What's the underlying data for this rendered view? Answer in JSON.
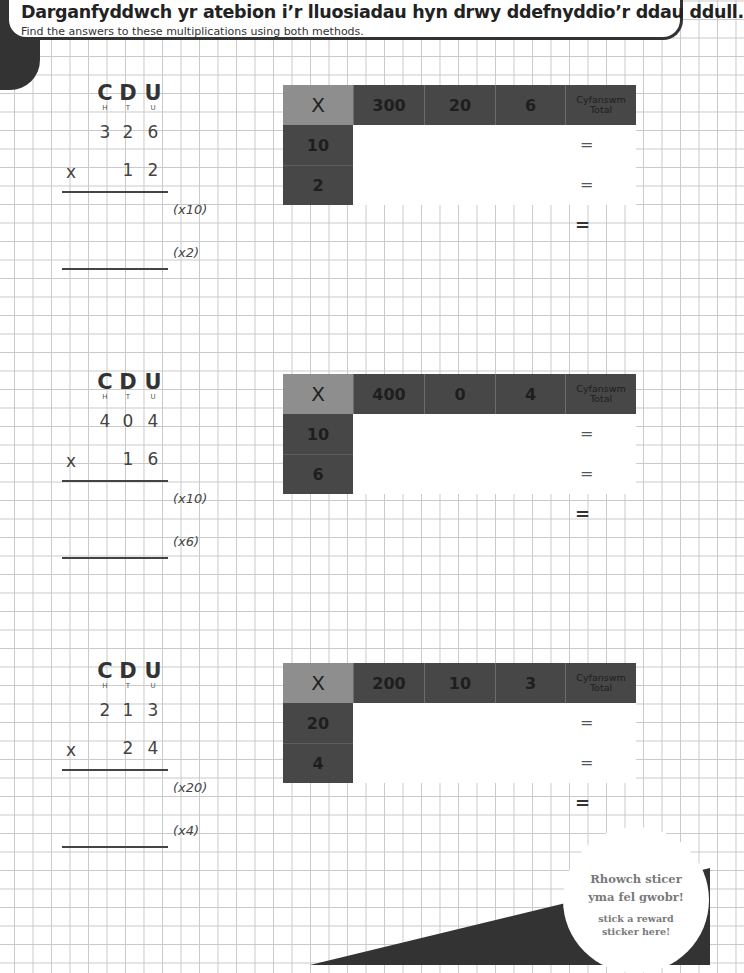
{
  "header": {
    "title": "Darganfyddwch yr atebion i’r lluosiadau hyn drwy ddefnyddio’r ddau ddull.",
    "subtitle": "Find the answers to these multiplications using both methods."
  },
  "place_values": {
    "hundreds": {
      "cy": "C",
      "en": "H"
    },
    "tens": {
      "cy": "D",
      "en": "T"
    },
    "units": {
      "cy": "U",
      "en": "U"
    }
  },
  "times_sign": "x",
  "equals": "=",
  "grid_corner": "X",
  "total_label": {
    "cy": "Cyfanswm",
    "en": "Total"
  },
  "problems": [
    {
      "multiplicand": [
        "3",
        "2",
        "6"
      ],
      "multiplier": [
        "1",
        "2"
      ],
      "partials": [
        "(x10)",
        "(x2)"
      ],
      "grid": {
        "columns": [
          "300",
          "20",
          "6"
        ],
        "rows": [
          "10",
          "2"
        ]
      }
    },
    {
      "multiplicand": [
        "4",
        "0",
        "4"
      ],
      "multiplier": [
        "1",
        "6"
      ],
      "partials": [
        "(x10)",
        "(x6)"
      ],
      "grid": {
        "columns": [
          "400",
          "0",
          "4"
        ],
        "rows": [
          "10",
          "6"
        ]
      }
    },
    {
      "multiplicand": [
        "2",
        "1",
        "3"
      ],
      "multiplier": [
        "2",
        "4"
      ],
      "partials": [
        "(x20)",
        "(x4)"
      ],
      "grid": {
        "columns": [
          "200",
          "10",
          "3"
        ],
        "rows": [
          "20",
          "4"
        ]
      }
    }
  ],
  "sticker": {
    "welsh": [
      "Rhowch sticer",
      "yma fel gwobr!"
    ],
    "english": [
      "stick a reward",
      "sticker here!"
    ]
  },
  "colors": {
    "dark": "#474747",
    "corner": "#8e8e8e",
    "grid_line": "#c9c9c9",
    "banner_border": "#333333"
  }
}
